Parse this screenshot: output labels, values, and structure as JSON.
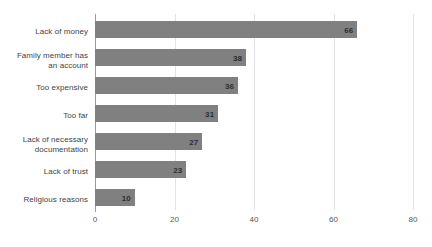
{
  "chart_data": {
    "type": "bar",
    "orientation": "horizontal",
    "title": "",
    "xlabel": "",
    "ylabel": "",
    "categories": [
      "Lack of money",
      "Family member has an account",
      "Too expensive",
      "Too far",
      "Lack of necessary documentation",
      "Lack of trust",
      "Religious reasons"
    ],
    "category_lines": [
      [
        "Lack of money"
      ],
      [
        "Family member has",
        "an account"
      ],
      [
        "Too expensive"
      ],
      [
        "Too far"
      ],
      [
        "Lack of necessary",
        "documentation"
      ],
      [
        "Lack of trust"
      ],
      [
        "Religious reasons"
      ]
    ],
    "values": [
      66,
      38,
      36,
      31,
      27,
      23,
      10
    ],
    "value_labels": [
      "66",
      "38",
      "36",
      "31",
      "27",
      "23",
      "10"
    ],
    "xlim": [
      0,
      80
    ],
    "xticks": [
      0,
      20,
      40,
      60,
      80
    ],
    "xtick_labels": [
      "0",
      "20",
      "40",
      "60",
      "80"
    ],
    "grid": true,
    "grid_axis": "x",
    "legend": false,
    "bar_color": "#808080",
    "gridline_color": "#e3e3e7",
    "axis_color": "#9a9aa0",
    "background_color": "#ffffff"
  },
  "layout": {
    "plot_left_px": 95,
    "plot_right_px": 413,
    "px_per_unit": 3.975,
    "row_top_px": 18,
    "row_height_px": 28,
    "bar_height_px": 17
  }
}
